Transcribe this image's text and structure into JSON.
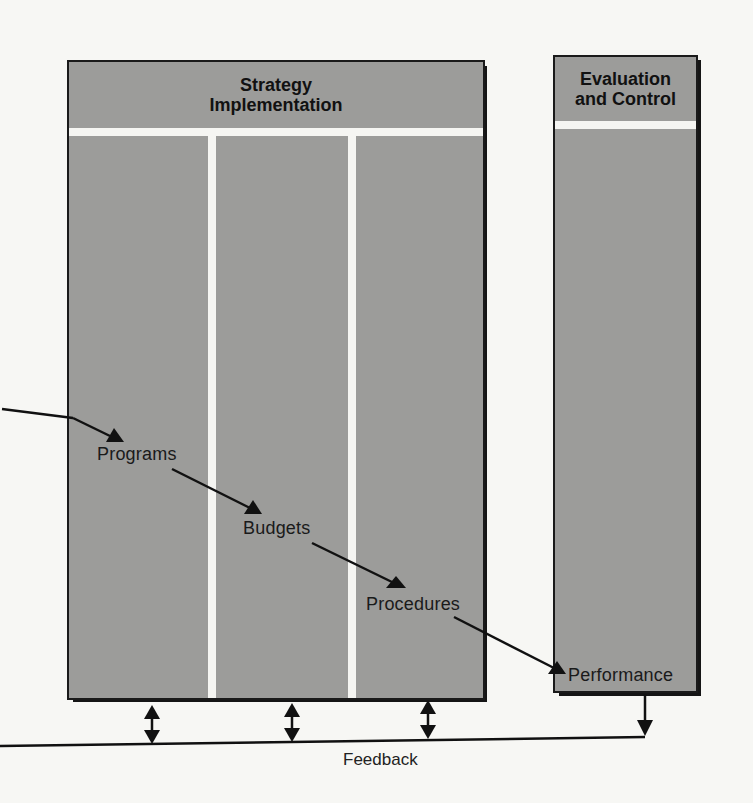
{
  "diagram": {
    "colors": {
      "box_fill": "#9c9c9a",
      "box_border": "#1a1a1a",
      "stripe": "#f5f5f2",
      "arrow": "#111111",
      "background": "#f7f7f4"
    },
    "strategy_implementation": {
      "title_line1": "Strategy",
      "title_line2": "Implementation",
      "columns": [
        {
          "label": "Programs"
        },
        {
          "label": "Budgets"
        },
        {
          "label": "Procedures"
        }
      ]
    },
    "evaluation_and_control": {
      "title_line1": "Evaluation",
      "title_line2": "and Control",
      "item": "Performance"
    },
    "feedback": {
      "label": "Feedback"
    },
    "flow": [
      {
        "from": "offscreen-left",
        "to": "Programs"
      },
      {
        "from": "Programs",
        "to": "Budgets"
      },
      {
        "from": "Budgets",
        "to": "Procedures"
      },
      {
        "from": "Procedures",
        "to": "Performance"
      },
      {
        "from": "Performance",
        "to": "Feedback"
      }
    ]
  }
}
